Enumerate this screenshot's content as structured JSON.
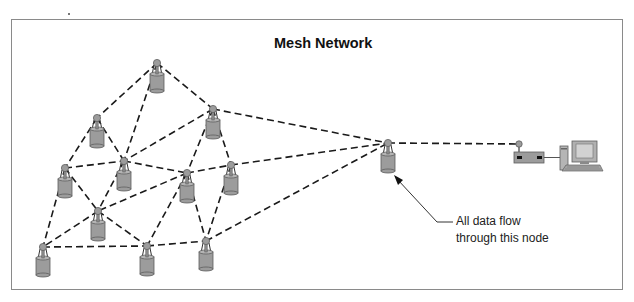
{
  "diagram": {
    "title": "Mesh Network",
    "caption": {
      "line1": "All data flow",
      "line2": "through this node"
    },
    "colors": {
      "node_fill": "#9c9c9c",
      "node_stroke": "#5e5e5e",
      "link": "#1a1a1a",
      "frame": "#8a8a8a"
    },
    "nodes": [
      {
        "id": "n1",
        "x": 157,
        "y": 63
      },
      {
        "id": "n2",
        "x": 97,
        "y": 118
      },
      {
        "id": "n3",
        "x": 213,
        "y": 109
      },
      {
        "id": "n4",
        "x": 65,
        "y": 168
      },
      {
        "id": "n5",
        "x": 124,
        "y": 161
      },
      {
        "id": "n6",
        "x": 187,
        "y": 173
      },
      {
        "id": "n7",
        "x": 231,
        "y": 165
      },
      {
        "id": "n8",
        "x": 98,
        "y": 211
      },
      {
        "id": "n9",
        "x": 43,
        "y": 247
      },
      {
        "id": "n10",
        "x": 147,
        "y": 246
      },
      {
        "id": "n11",
        "x": 206,
        "y": 241
      },
      {
        "id": "hub",
        "x": 388,
        "y": 143
      }
    ],
    "links": [
      [
        "n1",
        "n2"
      ],
      [
        "n1",
        "n3"
      ],
      [
        "n1",
        "n5"
      ],
      [
        "n2",
        "n4"
      ],
      [
        "n2",
        "n5"
      ],
      [
        "n3",
        "n5"
      ],
      [
        "n3",
        "n6"
      ],
      [
        "n3",
        "n7"
      ],
      [
        "n3",
        "hub"
      ],
      [
        "n4",
        "n5"
      ],
      [
        "n4",
        "n8"
      ],
      [
        "n4",
        "n9"
      ],
      [
        "n5",
        "n6"
      ],
      [
        "n5",
        "n8"
      ],
      [
        "n6",
        "n7"
      ],
      [
        "n6",
        "n8"
      ],
      [
        "n6",
        "n10"
      ],
      [
        "n6",
        "n11"
      ],
      [
        "n7",
        "n11"
      ],
      [
        "n7",
        "hub"
      ],
      [
        "n8",
        "n9"
      ],
      [
        "n8",
        "n10"
      ],
      [
        "n9",
        "n10"
      ],
      [
        "n10",
        "n11"
      ],
      [
        "n11",
        "hub"
      ],
      [
        "hub",
        "router"
      ]
    ],
    "router": {
      "x": 519,
      "y": 144
    },
    "computer": {
      "label": "computer"
    }
  }
}
